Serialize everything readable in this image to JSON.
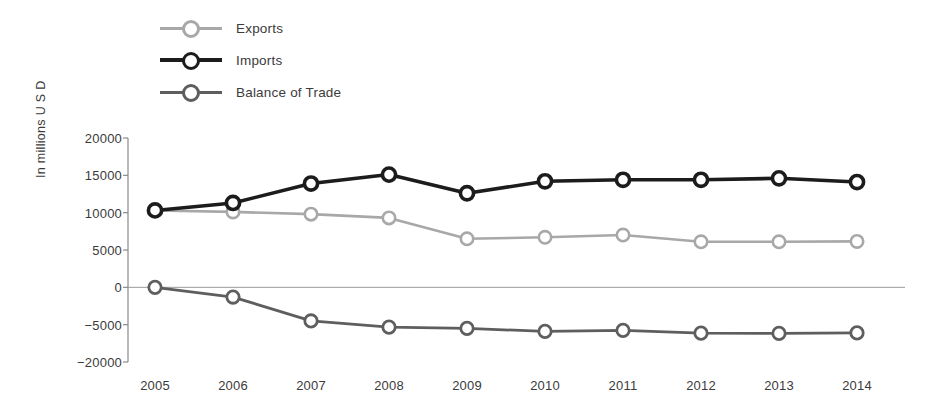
{
  "chart_data": {
    "type": "line",
    "title": "",
    "xlabel": "",
    "ylabel": "In millions U S D",
    "categories": [
      "2005",
      "2006",
      "2007",
      "2008",
      "2009",
      "2010",
      "2011",
      "2012",
      "2013",
      "2014"
    ],
    "ylim": [
      -20000,
      20000
    ],
    "ytick_labels": [
      "20000",
      "15000",
      "10000",
      "5000",
      "0",
      "−5000",
      "−20000"
    ],
    "ytick_values": [
      20000,
      15000,
      10000,
      5000,
      0,
      -5000,
      -20000
    ],
    "grid": false,
    "zero_line": true,
    "legend_position": "top-left",
    "series": [
      {
        "name": "Exports",
        "color": "#a8a8a8",
        "values": [
          10300,
          10100,
          9800,
          9300,
          6500,
          6700,
          7000,
          6100,
          6100,
          6150
        ]
      },
      {
        "name": "Imports",
        "color": "#1c1c1c",
        "values": [
          10300,
          11300,
          13900,
          15100,
          12600,
          14200,
          14400,
          14400,
          14600,
          14100
        ]
      },
      {
        "name": "Balance of Trade",
        "color": "#5e5e5e",
        "values": [
          0,
          -1300,
          -4500,
          -6000,
          -6500,
          -7700,
          -7300,
          -8400,
          -8500,
          -8300
        ]
      }
    ]
  },
  "legend": {
    "items": [
      {
        "label": "Exports"
      },
      {
        "label": "Imports"
      },
      {
        "label": "Balance of Trade"
      }
    ]
  }
}
